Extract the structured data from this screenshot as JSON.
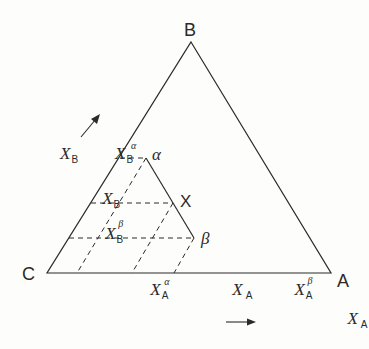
{
  "diagram": {
    "vertices": {
      "B": {
        "label": "B",
        "x": 191,
        "y": 42
      },
      "C": {
        "label": "C",
        "x": 47,
        "y": 273
      },
      "A": {
        "label": "A",
        "x": 331,
        "y": 273
      }
    },
    "tie_triangle": {
      "alpha": {
        "label": "α",
        "x": 146,
        "y": 158
      },
      "X": {
        "label": "X",
        "x": 173,
        "y": 203
      },
      "beta": {
        "label": "β",
        "x": 194,
        "y": 238
      }
    },
    "labels": {
      "XB_axis": {
        "main": "X",
        "sub": "B"
      },
      "XB_alpha": {
        "main": "X",
        "sub": "B",
        "sup": "α"
      },
      "XB": {
        "main": "X",
        "sub": "B"
      },
      "XB_beta": {
        "main": "X",
        "sub": "B",
        "sup": "β"
      },
      "XA_alpha": {
        "main": "X",
        "sub": "A",
        "sup": "α"
      },
      "XA": {
        "main": "X",
        "sub": "A"
      },
      "XA_beta": {
        "main": "X",
        "sub": "A",
        "sup": "β"
      },
      "XA_axis": {
        "main": "X",
        "sub": "A"
      }
    },
    "colors": {
      "line": "#2a2a2a",
      "background": "#fdfdfb"
    }
  }
}
